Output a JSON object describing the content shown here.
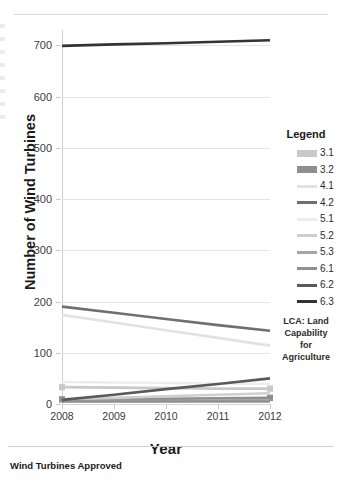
{
  "caption": "Wind Turbines Approved",
  "legend": {
    "title": "Legend",
    "note": "LCA: Land Capability for Agriculture",
    "note_lines": [
      "LCA: Land",
      "Capability",
      "for",
      "Agriculture"
    ],
    "items": [
      {
        "label": "3.1",
        "color": "#c9c9c9",
        "marker": true
      },
      {
        "label": "3.2",
        "color": "#8f8f8f",
        "marker": true
      },
      {
        "label": "4.1",
        "color": "#e2e2e2",
        "marker": false
      },
      {
        "label": "4.2",
        "color": "#6f6f6f",
        "marker": false
      },
      {
        "label": "5.1",
        "color": "#ededed",
        "marker": false
      },
      {
        "label": "5.2",
        "color": "#cfcfcf",
        "marker": false
      },
      {
        "label": "5.3",
        "color": "#a6a6a6",
        "marker": false
      },
      {
        "label": "6.1",
        "color": "#909090",
        "marker": false
      },
      {
        "label": "6.2",
        "color": "#5a5a5a",
        "marker": false
      },
      {
        "label": "6.3",
        "color": "#333333",
        "marker": false
      }
    ]
  },
  "chart_data": {
    "type": "line",
    "title": "Wind Turbines Approved",
    "xlabel": "Year",
    "ylabel": "Number of Wind Turbines",
    "x": [
      2008,
      2009,
      2010,
      2011,
      2012
    ],
    "xlim": [
      2008,
      2012
    ],
    "ylim": [
      0,
      730
    ],
    "yticks": [
      0,
      100,
      200,
      300,
      400,
      500,
      600,
      700
    ],
    "xticks": [
      "2008",
      "2009",
      "2010",
      "2011",
      "2012"
    ],
    "grid": "horizontal",
    "legend_position": "right",
    "series": [
      {
        "name": "3.1",
        "color": "#c9c9c9",
        "marker": true,
        "values": [
          33,
          32,
          31,
          30,
          30
        ]
      },
      {
        "name": "3.2",
        "color": "#8f8f8f",
        "marker": true,
        "values": [
          9,
          9,
          10,
          11,
          12
        ]
      },
      {
        "name": "4.1",
        "color": "#e2e2e2",
        "marker": false,
        "values": [
          174,
          159,
          144,
          129,
          114
        ]
      },
      {
        "name": "4.2",
        "color": "#6f6f6f",
        "marker": false,
        "values": [
          190,
          178,
          166,
          154,
          143
        ]
      },
      {
        "name": "5.1",
        "color": "#ededed",
        "marker": false,
        "values": [
          43,
          42,
          41,
          40,
          39
        ]
      },
      {
        "name": "5.2",
        "color": "#cfcfcf",
        "marker": false,
        "values": [
          9,
          12,
          15,
          18,
          21
        ]
      },
      {
        "name": "5.3",
        "color": "#a6a6a6",
        "marker": false,
        "values": [
          6,
          6,
          6,
          7,
          7
        ]
      },
      {
        "name": "6.1",
        "color": "#909090",
        "marker": false,
        "values": [
          5,
          5,
          5,
          5,
          5
        ]
      },
      {
        "name": "6.2",
        "color": "#5a5a5a",
        "marker": false,
        "values": [
          8,
          18,
          29,
          39,
          50
        ]
      },
      {
        "name": "6.3",
        "color": "#333333",
        "marker": false,
        "values": [
          699,
          702,
          704,
          707,
          710
        ]
      }
    ]
  }
}
